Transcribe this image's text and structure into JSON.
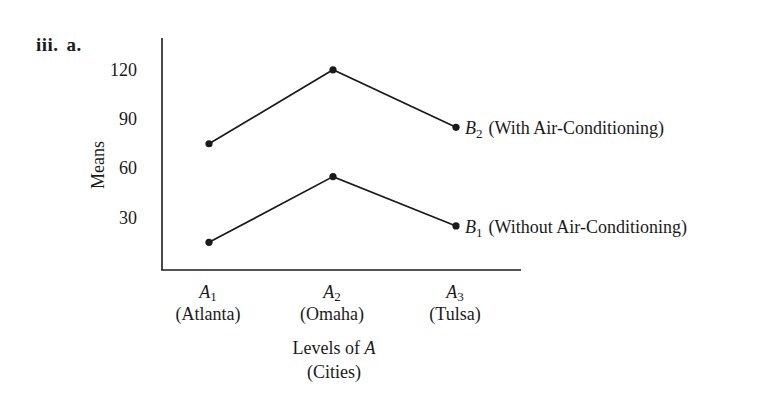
{
  "problem": {
    "number": "iii.",
    "part": "a."
  },
  "chart_data": {
    "type": "line",
    "title": "",
    "xlabel": "Levels of A",
    "xlabel_sub": "(Cities)",
    "ylabel": "Means",
    "ylim": [
      0,
      135
    ],
    "yticks": [
      30,
      60,
      90,
      120
    ],
    "grid": false,
    "legend_position": "inline-right",
    "categories": [
      {
        "symbol": "A",
        "sub": "1",
        "name": "(Atlanta)"
      },
      {
        "symbol": "A",
        "sub": "2",
        "name": "(Omaha)"
      },
      {
        "symbol": "A",
        "sub": "3",
        "name": "(Tulsa)"
      }
    ],
    "series": [
      {
        "symbol": "B",
        "sub": "2",
        "name": "(With Air-Conditioning)",
        "values": [
          75,
          120,
          85
        ]
      },
      {
        "symbol": "B",
        "sub": "1",
        "name": "(Without Air-Conditioning)",
        "values": [
          15,
          55,
          25
        ]
      }
    ]
  },
  "colors": {
    "ink": "#1a1a1a",
    "background": "#ffffff"
  }
}
